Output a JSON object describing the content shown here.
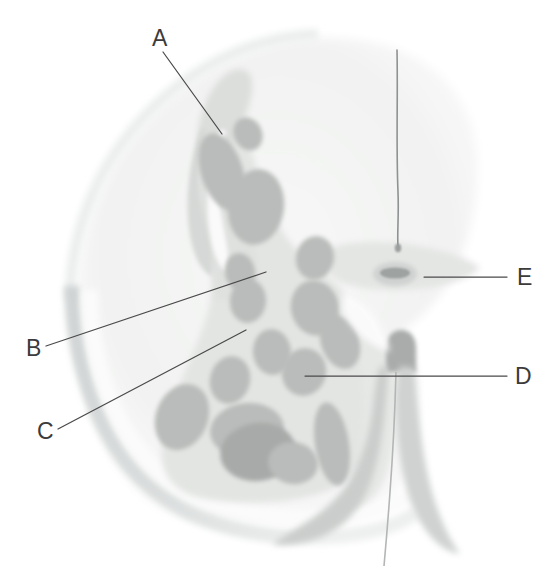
{
  "figure": {
    "kind": "medical-illustration",
    "width": 555,
    "height": 574,
    "background_color": "#ffffff"
  },
  "palette": {
    "background": "#ffffff",
    "capsule_rim": "#d9dcdc",
    "capsule_rim_dark": "#c4c8c8",
    "parenchyma_pale": "#f0f1f0",
    "parenchyma_mid": "#e2e4e2",
    "parenchyma_core": "#dcdedc",
    "follicle": "#b9bcba",
    "follicle_overlap": "#a7aaa8",
    "crypt_dark": "#a9acaa",
    "septum_line": "#8e9290",
    "label_text": "#3b3b3b",
    "leader_line": "#4a4a4a"
  },
  "labels": [
    {
      "id": "A",
      "text": "A",
      "text_x": 152,
      "text_y": 46,
      "line": {
        "x1": 163,
        "y1": 52,
        "x2": 222,
        "y2": 134
      }
    },
    {
      "id": "B",
      "text": "B",
      "text_x": 26,
      "text_y": 356,
      "line": {
        "x1": 46,
        "y1": 346,
        "x2": 266,
        "y2": 272
      }
    },
    {
      "id": "C",
      "text": "C",
      "text_x": 37,
      "text_y": 439,
      "line": {
        "x1": 58,
        "y1": 429,
        "x2": 246,
        "y2": 330
      }
    },
    {
      "id": "D",
      "text": "D",
      "text_x": 515,
      "text_y": 384,
      "line": {
        "x1": 305,
        "y1": 376,
        "x2": 507,
        "y2": 376
      }
    },
    {
      "id": "E",
      "text": "E",
      "text_x": 517,
      "text_y": 285,
      "line": {
        "x1": 424,
        "y1": 277,
        "x2": 507,
        "y2": 277
      }
    }
  ],
  "follicles": [
    {
      "name": "follicle-upper-elongated",
      "cx": 222,
      "cy": 172,
      "rx": 21,
      "ry": 40,
      "rot": -18,
      "shade": "follicle"
    },
    {
      "name": "follicle-upper-small",
      "cx": 248,
      "cy": 134,
      "rx": 14,
      "ry": 17,
      "rot": -25,
      "shade": "follicle"
    },
    {
      "name": "follicle-mid-upper-large",
      "cx": 256,
      "cy": 207,
      "rx": 28,
      "ry": 38,
      "rot": 8,
      "shade": "follicle"
    },
    {
      "name": "follicle-left-small",
      "cx": 240,
      "cy": 272,
      "rx": 15,
      "ry": 19,
      "rot": -10,
      "shade": "follicle"
    },
    {
      "name": "follicle-right-upper",
      "cx": 315,
      "cy": 258,
      "rx": 19,
      "ry": 22,
      "rot": 12,
      "shade": "follicle"
    },
    {
      "name": "follicle-center-right",
      "cx": 315,
      "cy": 308,
      "rx": 24,
      "ry": 28,
      "rot": -14,
      "shade": "follicle"
    },
    {
      "name": "follicle-center-left",
      "cx": 248,
      "cy": 301,
      "rx": 18,
      "ry": 22,
      "rot": 5,
      "shade": "follicle"
    },
    {
      "name": "follicle-core-b",
      "cx": 272,
      "cy": 352,
      "rx": 19,
      "ry": 23,
      "rot": -6,
      "shade": "follicle"
    },
    {
      "name": "follicle-core-mid",
      "cx": 290,
      "cy": 308,
      "rx": 0,
      "ry": 0,
      "rot": 0,
      "shade": "none"
    },
    {
      "name": "follicle-d-target",
      "cx": 304,
      "cy": 372,
      "rx": 22,
      "ry": 24,
      "rot": 18,
      "shade": "follicle"
    },
    {
      "name": "follicle-right-lower",
      "cx": 340,
      "cy": 342,
      "rx": 19,
      "ry": 28,
      "rot": -20,
      "shade": "follicle"
    },
    {
      "name": "follicle-right-tall",
      "cx": 332,
      "cy": 444,
      "rx": 17,
      "ry": 42,
      "rot": -9,
      "shade": "follicle"
    },
    {
      "name": "follicle-left-mid",
      "cx": 230,
      "cy": 380,
      "rx": 20,
      "ry": 24,
      "rot": 14,
      "shade": "follicle"
    },
    {
      "name": "follicle-left-lower-large",
      "cx": 182,
      "cy": 417,
      "rx": 26,
      "ry": 34,
      "rot": 22,
      "shade": "follicle"
    },
    {
      "name": "follicle-bottom-wide",
      "cx": 247,
      "cy": 430,
      "rx": 37,
      "ry": 27,
      "rot": -6,
      "shade": "follicle"
    },
    {
      "name": "follicle-bottom-overlap",
      "cx": 258,
      "cy": 452,
      "rx": 38,
      "ry": 29,
      "rot": -8,
      "shade": "follicle_overlap"
    },
    {
      "name": "follicle-bottom-right",
      "cx": 293,
      "cy": 463,
      "rx": 25,
      "ry": 21,
      "rot": 10,
      "shade": "follicle"
    }
  ],
  "structures": [
    {
      "name": "capsule-arc",
      "description": "outer curved capsule rim on left and bottom"
    },
    {
      "name": "septum-filament",
      "description": "thin vertical dark line upper right"
    },
    {
      "name": "crypt-e-spot",
      "description": "small dark elongated crypt marked E"
    },
    {
      "name": "hook-process-d",
      "description": "hook shaped dark process lower right"
    }
  ]
}
